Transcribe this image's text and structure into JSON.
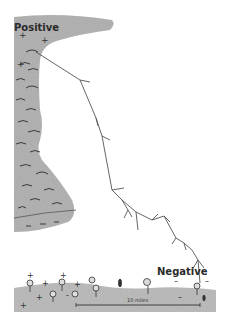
{
  "diagram": {
    "type": "cloud-to-ground lightning illustration",
    "labels": {
      "positive": "Positive",
      "negative": "Negative",
      "distance": "10 miles"
    },
    "colors": {
      "cloud": "#b4b4b4",
      "ground": "#bdbdbd",
      "bolt": "#555555",
      "text": "#2a2a2a"
    },
    "charges": {
      "cloud_top": "+",
      "cloud_body": "-",
      "ground_left": "+",
      "ground_right": "-"
    }
  }
}
